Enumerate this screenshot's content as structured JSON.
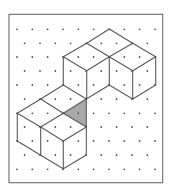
{
  "figure": {
    "frame": {
      "x": 9,
      "y": 14.3,
      "width": 153.7,
      "height": 168.4,
      "stroke": "#6b6b6b"
    },
    "colors": {
      "background": "#ffffff",
      "line": "#5a5a5a",
      "dot": "#555555",
      "shade": "#a9a9a9"
    },
    "dot_grid": {
      "row_y": [
        29.3,
        43.3,
        57,
        71,
        85,
        99,
        113.3,
        127,
        141,
        155,
        169.3
      ],
      "even_row_x": [
        17,
        32.3,
        47.6,
        63,
        78.3,
        93.6,
        109,
        124.3,
        139.6,
        155
      ],
      "odd_row_x": [
        24.6,
        40,
        55.3,
        70.6,
        86,
        101.3,
        116.6,
        132,
        147.3
      ],
      "dot_radius": 0.9
    },
    "shaded_triangle": [
      [
        63.3,
        113.3
      ],
      [
        86.3,
        99
      ],
      [
        86.3,
        127
      ]
    ],
    "edges": [
      [
        [
          109.3,
          29
        ],
        [
          86.7,
          43.3
        ]
      ],
      [
        [
          109.3,
          29
        ],
        [
          132.7,
          43.3
        ]
      ],
      [
        [
          86.7,
          43.3
        ],
        [
          63.3,
          56.7
        ]
      ],
      [
        [
          86.7,
          43.3
        ],
        [
          109.3,
          56.7
        ]
      ],
      [
        [
          132.7,
          43.3
        ],
        [
          109.3,
          56.7
        ]
      ],
      [
        [
          132.7,
          43.3
        ],
        [
          155.7,
          56.7
        ]
      ],
      [
        [
          63.3,
          56.7
        ],
        [
          86.7,
          70.7
        ]
      ],
      [
        [
          86.7,
          70.7
        ],
        [
          109.3,
          56.7
        ]
      ],
      [
        [
          109.3,
          56.7
        ],
        [
          132.7,
          70.7
        ]
      ],
      [
        [
          132.7,
          70.7
        ],
        [
          155.7,
          56.7
        ]
      ],
      [
        [
          63.3,
          56.7
        ],
        [
          63.3,
          85
        ]
      ],
      [
        [
          86.7,
          70.7
        ],
        [
          86.7,
          99
        ]
      ],
      [
        [
          109.3,
          56.7
        ],
        [
          109.3,
          85
        ]
      ],
      [
        [
          132.7,
          70.7
        ],
        [
          132.7,
          99
        ]
      ],
      [
        [
          155.7,
          56.7
        ],
        [
          155.7,
          85
        ]
      ],
      [
        [
          109.3,
          85
        ],
        [
          132.7,
          99
        ]
      ],
      [
        [
          132.7,
          99
        ],
        [
          155.7,
          85
        ]
      ],
      [
        [
          109.3,
          85
        ],
        [
          86.3,
          99
        ]
      ],
      [
        [
          63.3,
          85
        ],
        [
          86.3,
          99
        ]
      ],
      [
        [
          63.3,
          85
        ],
        [
          40.7,
          99
        ]
      ],
      [
        [
          40.7,
          99
        ],
        [
          17.3,
          113.3
        ]
      ],
      [
        [
          40.7,
          99
        ],
        [
          63.3,
          113.3
        ]
      ],
      [
        [
          63.3,
          113.3
        ],
        [
          86.3,
          99
        ]
      ],
      [
        [
          86.3,
          99
        ],
        [
          86.3,
          127
        ]
      ],
      [
        [
          17.3,
          113.3
        ],
        [
          40.7,
          127
        ]
      ],
      [
        [
          40.7,
          127
        ],
        [
          63.3,
          113.3
        ]
      ],
      [
        [
          63.3,
          113.3
        ],
        [
          86.3,
          127
        ]
      ],
      [
        [
          40.7,
          127
        ],
        [
          63.3,
          141
        ]
      ],
      [
        [
          63.3,
          141
        ],
        [
          86.3,
          127
        ]
      ],
      [
        [
          17.3,
          113.3
        ],
        [
          17.3,
          141
        ]
      ],
      [
        [
          40.7,
          127
        ],
        [
          40.7,
          155.3
        ]
      ],
      [
        [
          63.3,
          141
        ],
        [
          63.3,
          168.7
        ]
      ],
      [
        [
          86.3,
          127
        ],
        [
          86.3,
          155
        ]
      ],
      [
        [
          17.3,
          141
        ],
        [
          40.7,
          155.3
        ]
      ],
      [
        [
          40.7,
          155.3
        ],
        [
          63.3,
          168.7
        ]
      ],
      [
        [
          63.3,
          168.7
        ],
        [
          86.3,
          155
        ]
      ]
    ]
  }
}
